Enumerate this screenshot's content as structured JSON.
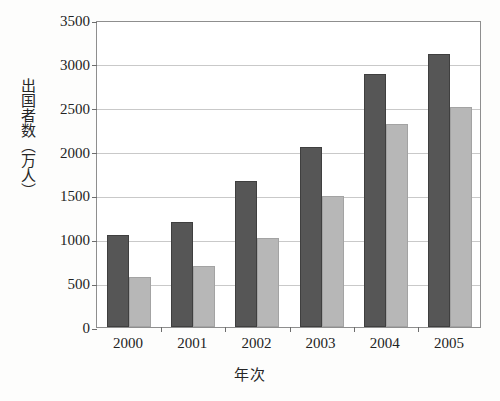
{
  "chart_data": {
    "type": "bar",
    "title": "",
    "subtitle": "",
    "xlabel": "年次",
    "ylabel": "出国者数（万人）",
    "categories": [
      "2000",
      "2001",
      "2002",
      "2003",
      "2004",
      "2005"
    ],
    "series": [
      {
        "name": "dark-series",
        "color": "#565656",
        "values": [
          1050,
          1200,
          1670,
          2050,
          2890,
          3110
        ]
      },
      {
        "name": "light-series",
        "color": "#b7b7b7",
        "values": [
          570,
          700,
          1010,
          1490,
          2310,
          2510
        ]
      }
    ],
    "ylim": [
      0,
      3500
    ],
    "ytick_labels": [
      "0",
      "500",
      "1000",
      "1500",
      "2000",
      "2500",
      "3000",
      "3500"
    ],
    "ytick_values": [
      0,
      500,
      1000,
      1500,
      2000,
      2500,
      3000,
      3500
    ],
    "grid": true,
    "grid_axis": "y",
    "legend": false,
    "legend_position": "none"
  },
  "axes": {
    "y_title": "出国者数（万人）",
    "x_title": "年次"
  }
}
